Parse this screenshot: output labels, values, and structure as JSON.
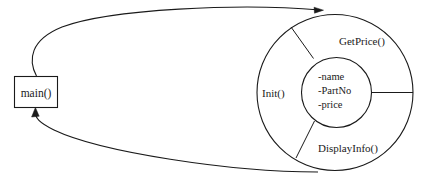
{
  "diagram": {
    "type": "object-model-diagram",
    "caller": {
      "label": "main()"
    },
    "object": {
      "attributes": [
        "-name",
        "-PartNo",
        "-price"
      ],
      "methods": [
        {
          "name": "GetPrice()"
        },
        {
          "name": "Init()"
        },
        {
          "name": "DisplayInfo()"
        }
      ]
    },
    "connections": [
      {
        "name": "call-arrow",
        "from": "main()",
        "to": "object"
      },
      {
        "name": "return-arrow",
        "from": "object",
        "to": "main()"
      }
    ],
    "colors": {
      "stroke": "#1a1a1a",
      "background": "#ffffff"
    }
  }
}
